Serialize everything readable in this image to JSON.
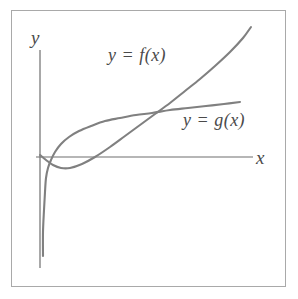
{
  "figure": {
    "background_color": "#ffffff",
    "frame_color": "#a9a9a9",
    "stroke_color": "#808080",
    "text_color": "#4a4a4a"
  },
  "axes": {
    "y_axis_label": "y",
    "x_axis_label": "x"
  },
  "labels": {
    "f_label": "y = f(x)",
    "g_label": "y = g(x)"
  },
  "chart_data": {
    "type": "line",
    "title": "",
    "xlabel": "x",
    "ylabel": "y",
    "grid": false,
    "legend_position": "inline-annotations",
    "axis_origin_px": {
      "x": 40,
      "y": 157
    },
    "x_axis_extent_px": {
      "from": 36,
      "to": 253
    },
    "y_axis_extent_px": {
      "from": 50,
      "to": 268
    },
    "series": [
      {
        "name": "y = f(x)",
        "label": "y = f(x)",
        "description": "Curve starting on the y-axis just above the x-axis, dipping slightly below the x-axis, then rising steeply and nearly linearly to the upper right; crosses g(x) once.",
        "color": "#808080",
        "points_px": [
          [
            40,
            155
          ],
          [
            46,
            160
          ],
          [
            53,
            165
          ],
          [
            61,
            168
          ],
          [
            70,
            168
          ],
          [
            82,
            164
          ],
          [
            95,
            157
          ],
          [
            110,
            147
          ],
          [
            125,
            136
          ],
          [
            140,
            125
          ],
          [
            155,
            114
          ],
          [
            170,
            103
          ],
          [
            185,
            91
          ],
          [
            200,
            79
          ],
          [
            215,
            66
          ],
          [
            230,
            52
          ],
          [
            243,
            38
          ],
          [
            251,
            27
          ]
        ]
      },
      {
        "name": "y = g(x)",
        "label": "y = g(x)",
        "description": "Logarithm-like curve with a vertical asymptote at the y-axis: rises steeply from low on the y-axis, crosses the x-axis near x=46, then flattens out and rises slowly to the right; crosses f(x) once.",
        "color": "#808080",
        "points_px": [
          [
            43,
            256
          ],
          [
            43,
            232
          ],
          [
            44,
            210
          ],
          [
            45,
            192
          ],
          [
            46,
            178
          ],
          [
            48,
            168
          ],
          [
            51,
            160
          ],
          [
            55,
            152
          ],
          [
            61,
            144
          ],
          [
            69,
            137
          ],
          [
            79,
            131
          ],
          [
            91,
            126
          ],
          [
            105,
            121
          ],
          [
            120,
            118
          ],
          [
            136,
            115
          ],
          [
            152,
            113
          ],
          [
            170,
            110
          ],
          [
            188,
            108
          ],
          [
            206,
            106
          ],
          [
            224,
            104
          ],
          [
            240,
            102
          ]
        ]
      }
    ],
    "annotations": [
      {
        "name": "intersection",
        "description": "f(x) and g(x) intersect at approximately pixel (155, 113)",
        "px": [
          155,
          113
        ]
      },
      {
        "name": "g-x-intercept",
        "description": "g(x) crosses the x-axis near pixel (46, 157)",
        "px": [
          46,
          157
        ]
      }
    ]
  }
}
